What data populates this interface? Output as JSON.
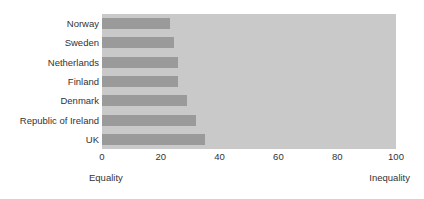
{
  "chart_data": {
    "type": "bar",
    "orientation": "horizontal",
    "title": "",
    "subtitle": "",
    "xlabel": "",
    "ylabel": "",
    "categories": [
      "Norway",
      "Sweden",
      "Netherlands",
      "Finland",
      "Denmark",
      "Republic of Ireland",
      "UK"
    ],
    "values": [
      23,
      24.5,
      26,
      26,
      29,
      32,
      35
    ],
    "series": [
      {
        "name": "Income inequality",
        "values": [
          23,
          24.5,
          26,
          26,
          29,
          32,
          35
        ]
      }
    ],
    "xlim": [
      0,
      100
    ],
    "xticks": [
      0,
      20,
      40,
      60,
      80,
      100
    ],
    "xtick_labels": [
      "0",
      "20",
      "40",
      "60",
      "80",
      "100"
    ],
    "grid": false,
    "legend": false,
    "legend_position": "none",
    "annotations": {
      "axis_low_end": "Equality",
      "axis_high_end": "Inequality"
    },
    "colors": {
      "bar": "#9a9a9a",
      "plot_background": "#c9c9c9",
      "figure_background": "#ffffff",
      "text": "#333333"
    }
  }
}
